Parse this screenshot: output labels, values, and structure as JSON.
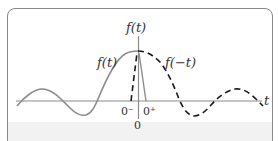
{
  "diagram": {
    "axis_labels": {
      "vertical": "f(t)",
      "horizontal": "t"
    },
    "curve_labels": {
      "solid": "f(t)",
      "dashed": "f(−t)"
    },
    "ticks": {
      "zero_minus": "0⁻",
      "zero_plus": "0⁺",
      "zero": "0"
    },
    "colors": {
      "solid_curve": "#8c8c8c",
      "dashed_curve": "#1a1a1a",
      "axes": "#8c8c8c",
      "frame": "#8a8a8a",
      "band": "#f2f2f2"
    }
  }
}
